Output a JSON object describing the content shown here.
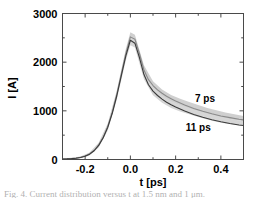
{
  "chart_data": {
    "type": "line",
    "title": "",
    "xlabel": "t [ps]",
    "ylabel": "I [A]",
    "xlim": [
      -0.3,
      0.5
    ],
    "ylim": [
      0,
      3000
    ],
    "xticks": [
      -0.2,
      0.0,
      0.2,
      0.4
    ],
    "xticklabels": [
      "-0.2",
      "0.0",
      "0.2",
      "0.4"
    ],
    "yticks": [
      0,
      1000,
      2000,
      3000
    ],
    "yticklabels": [
      "0",
      "1000",
      "2000",
      "3000"
    ],
    "xminorticks": [
      -0.3,
      -0.1,
      0.1,
      0.3,
      0.5
    ],
    "yminorticks": [
      500,
      1500,
      2500
    ],
    "grid": false,
    "legend_position": "inline-annotations",
    "annotations": [
      {
        "text": "7 ps",
        "x": 0.33,
        "y": 1180
      },
      {
        "text": "11 ps",
        "x": 0.3,
        "y": 590
      }
    ],
    "series": [
      {
        "name": "7 ps",
        "color": "#8a8a8a",
        "linewidth": 1.1,
        "x": [
          -0.3,
          -0.28,
          -0.26,
          -0.24,
          -0.22,
          -0.2,
          -0.18,
          -0.16,
          -0.14,
          -0.12,
          -0.1,
          -0.08,
          -0.06,
          -0.04,
          -0.02,
          0.0,
          0.02,
          0.04,
          0.06,
          0.08,
          0.1,
          0.12,
          0.14,
          0.16,
          0.18,
          0.2,
          0.24,
          0.28,
          0.32,
          0.36,
          0.4,
          0.44,
          0.48,
          0.5
        ],
        "values": [
          10,
          14,
          20,
          30,
          46,
          72,
          118,
          190,
          300,
          460,
          680,
          975,
          1340,
          1760,
          2180,
          2520,
          2470,
          2180,
          1840,
          1640,
          1520,
          1430,
          1360,
          1300,
          1250,
          1200,
          1120,
          1050,
          990,
          940,
          895,
          860,
          828,
          815
        ]
      },
      {
        "name": "11 ps",
        "color": "#3a3a3a",
        "linewidth": 1.1,
        "x": [
          -0.3,
          -0.28,
          -0.26,
          -0.24,
          -0.22,
          -0.2,
          -0.18,
          -0.16,
          -0.14,
          -0.12,
          -0.1,
          -0.08,
          -0.06,
          -0.04,
          -0.02,
          0.0,
          0.02,
          0.04,
          0.06,
          0.08,
          0.1,
          0.12,
          0.14,
          0.16,
          0.18,
          0.2,
          0.24,
          0.28,
          0.32,
          0.36,
          0.4,
          0.44,
          0.48,
          0.5
        ],
        "values": [
          8,
          12,
          18,
          27,
          42,
          66,
          110,
          180,
          288,
          445,
          660,
          950,
          1310,
          1725,
          2130,
          2450,
          2390,
          2095,
          1745,
          1535,
          1405,
          1315,
          1240,
          1178,
          1125,
          1078,
          995,
          925,
          868,
          818,
          775,
          740,
          710,
          698
        ]
      }
    ],
    "bands": [
      {
        "name": "7 ps uncertainty band",
        "color": "#cfcfcf",
        "x": [
          -0.3,
          -0.26,
          -0.22,
          -0.18,
          -0.14,
          -0.1,
          -0.06,
          -0.02,
          0.0,
          0.02,
          0.06,
          0.1,
          0.14,
          0.18,
          0.22,
          0.26,
          0.3,
          0.34,
          0.38,
          0.42,
          0.46,
          0.5
        ],
        "upper": [
          22,
          34,
          62,
          146,
          342,
          742,
          1420,
          2275,
          2615,
          2565,
          1935,
          1610,
          1438,
          1325,
          1248,
          1180,
          1118,
          1060,
          1010,
          966,
          928,
          895
        ],
        "lower": [
          2,
          9,
          31,
          92,
          262,
          620,
          1262,
          2090,
          2420,
          2378,
          1760,
          1435,
          1285,
          1180,
          1108,
          1045,
          985,
          930,
          885,
          845,
          810,
          785
        ]
      },
      {
        "name": "11 ps uncertainty band",
        "color": "#d6d6d6",
        "x": [
          -0.3,
          -0.26,
          -0.22,
          -0.18,
          -0.14,
          -0.1,
          -0.06,
          -0.02,
          0.0,
          0.02,
          0.06,
          0.1,
          0.14,
          0.18,
          0.22,
          0.26,
          0.3,
          0.34,
          0.38,
          0.42,
          0.46,
          0.5
        ],
        "upper": [
          18,
          30,
          56,
          136,
          326,
          718,
          1388,
          2218,
          2545,
          2495,
          1842,
          1490,
          1315,
          1198,
          1122,
          1058,
          998,
          945,
          898,
          855,
          818,
          790
        ],
        "lower": [
          1,
          7,
          27,
          84,
          248,
          598,
          1230,
          2035,
          2350,
          2300,
          1650,
          1320,
          1168,
          1058,
          988,
          928,
          872,
          822,
          778,
          742,
          712,
          690
        ]
      }
    ]
  },
  "figure": {
    "caption": "Fig. 4. Current distribution versus t at 1.5 nm and 1 μm."
  }
}
